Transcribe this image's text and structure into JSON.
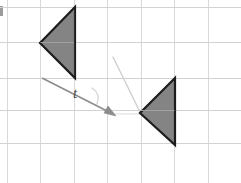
{
  "figure": {
    "canvas": {
      "width": 241,
      "height": 183,
      "background": "#ffffff"
    },
    "labels": {
      "vector_label": "t"
    }
  },
  "colors": {
    "grid": "#d9d9d9",
    "grid_strong": "#d2d2d2",
    "shape_fill": "#848484",
    "shape_stroke": "#1c1c1c",
    "vector_stroke": "#8c8c8c",
    "ghost_stroke": "#cfcfcf",
    "label_text": "#4a4a4a",
    "artifact": "#8a8a8a"
  },
  "grid": {
    "x_lines": [
      7,
      40.5,
      74,
      107.5,
      141,
      174.5,
      208
    ],
    "y_lines": [
      7,
      42.5,
      78,
      110.5,
      143
    ],
    "cell_width": 33.5,
    "cell_height": 35
  },
  "shapes": [
    {
      "name": "preimage-triangle",
      "points": "75,7 40,43 75,78",
      "fill": "#848484",
      "stroke": "#1c1c1c",
      "stroke_width": 2.2
    },
    {
      "name": "image-triangle",
      "points": "175,78 140,113 175,145",
      "fill": "#848484",
      "stroke": "#1c1c1c",
      "stroke_width": 2.2
    }
  ],
  "vector": {
    "name": "translation-vector-t",
    "start": {
      "x": 42,
      "y": 78
    },
    "end": {
      "x": 113,
      "y": 114
    },
    "stroke": "#8c8c8c",
    "stroke_width": 1.6,
    "arrowhead": "108,106 116,116 104,113",
    "label": "t",
    "label_x": 75,
    "label_y": 98
  },
  "ghost_marks": [
    {
      "name": "ghost-guide-line",
      "path": "M 113,57 L 140,112",
      "stroke": "#cfcfcf",
      "stroke_width": 1.4
    },
    {
      "name": "ghost-arc-near-label",
      "path": "M 92,88 Q 101,94 97,104",
      "stroke": "#d4d4d4",
      "stroke_width": 1.3
    },
    {
      "name": "ghost-baseline-segment",
      "path": "M 114,114 L 141,114",
      "stroke": "#dcdcdc",
      "stroke_width": 1.2
    }
  ]
}
